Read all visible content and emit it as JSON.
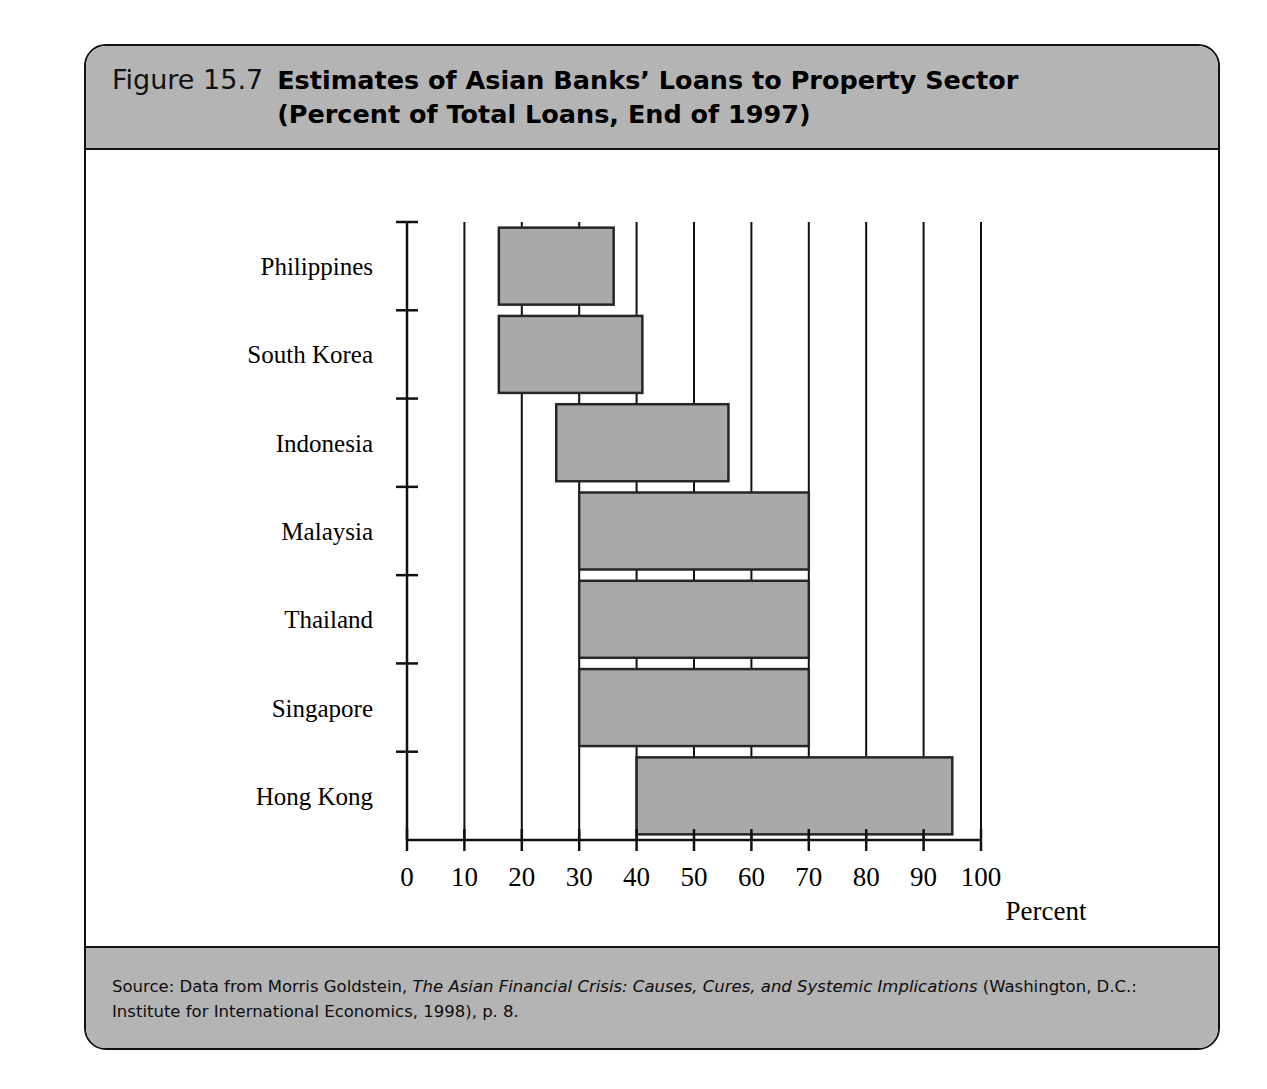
{
  "figure": {
    "number": "Figure 15.7",
    "title_line1": "Estimates of Asian Banks’ Loans to Property Sector",
    "title_line2": "(Percent of Total Loans, End of 1997)",
    "header_color": "#b4b4b4",
    "frame_color": "#111111"
  },
  "source": {
    "prefix": "Source: Data from Morris Goldstein, ",
    "italic_title": "The Asian Financial Crisis: Causes, Cures, and Systemic Implications",
    "suffix": " (Washington, D.C.: Institute for International Economics, 1998), p. 8."
  },
  "chart_data": {
    "type": "bar",
    "orientation": "horizontal",
    "subtype": "floating-range-bar",
    "title": "Estimates of Asian Banks’ Loans to Property Sector (Percent of Total Loans, End of 1997)",
    "xlabel": "Percent",
    "ylabel": "",
    "xlim": [
      0,
      100
    ],
    "xticks": [
      0,
      10,
      20,
      30,
      40,
      50,
      60,
      70,
      80,
      90,
      100
    ],
    "xtick_labels": [
      "0",
      "10",
      "20",
      "30",
      "40",
      "50",
      "60",
      "70",
      "80",
      "90",
      "100"
    ],
    "grid": "vertical",
    "legend": "none",
    "bar_fill": "#a9a9a9",
    "bar_stroke": "#262626",
    "categories": [
      "Philippines",
      "South Korea",
      "Indonesia",
      "Malaysia",
      "Thailand",
      "Singapore",
      "Hong Kong"
    ],
    "low_values": [
      16,
      16,
      26,
      30,
      30,
      30,
      40
    ],
    "high_values": [
      36,
      41,
      56,
      70,
      70,
      70,
      95
    ],
    "series": [
      {
        "name": "Low estimate",
        "values": [
          16,
          16,
          26,
          30,
          30,
          30,
          40
        ]
      },
      {
        "name": "High estimate",
        "values": [
          36,
          41,
          56,
          70,
          70,
          70,
          95
        ]
      }
    ],
    "bars": [
      {
        "category": "Philippines",
        "low": 16,
        "high": 36
      },
      {
        "category": "South Korea",
        "low": 16,
        "high": 41
      },
      {
        "category": "Indonesia",
        "low": 26,
        "high": 56
      },
      {
        "category": "Malaysia",
        "low": 30,
        "high": 70
      },
      {
        "category": "Thailand",
        "low": 30,
        "high": 70
      },
      {
        "category": "Singapore",
        "low": 30,
        "high": 70
      },
      {
        "category": "Hong Kong",
        "low": 40,
        "high": 95
      }
    ]
  }
}
